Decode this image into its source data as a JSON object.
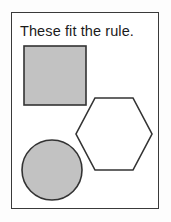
{
  "card": {
    "width": 171,
    "height": 222,
    "background_color": "#fdfdfd"
  },
  "frame": {
    "name": "rule-card-frame",
    "x": 11,
    "y": 12,
    "width": 148,
    "height": 197,
    "border_color": "#3a3a3a",
    "border_width": 1.4,
    "fill_color": "#ffffff"
  },
  "caption": {
    "text": "These fit the rule.",
    "x": 20,
    "y": 23,
    "font_size": 14.5,
    "color": "#1b1b1b"
  },
  "palette": {
    "shape_fill_gray": "#c2c2c2",
    "shape_stroke_dark": "#333333",
    "shape_fill_white": "#ffffff",
    "page_white": "#ffffff"
  },
  "shapes": [
    {
      "name": "gray-square",
      "type": "square",
      "label": "square",
      "fill": "#c2c2c2",
      "stroke": "#333333",
      "stroke_width": 1.6,
      "x": 24,
      "y": 46,
      "width": 62,
      "height": 59
    },
    {
      "name": "white-hexagon",
      "type": "hexagon",
      "label": "hexagon",
      "fill": "#ffffff",
      "stroke": "#333333",
      "stroke_width": 1.6,
      "points": "95,98 133,98 152,134 133,170 95,170 76,134",
      "bbox": {
        "x": 76,
        "y": 98,
        "width": 76,
        "height": 72
      }
    },
    {
      "name": "gray-circle",
      "type": "circle",
      "label": "circle",
      "fill": "#c2c2c2",
      "stroke": "#333333",
      "stroke_width": 1.6,
      "cx": 52,
      "cy": 170,
      "r": 30
    }
  ]
}
